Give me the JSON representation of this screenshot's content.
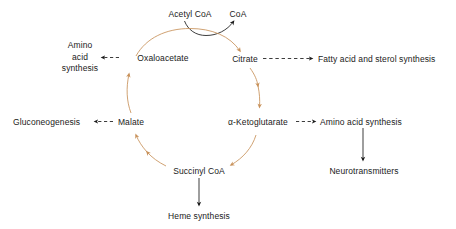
{
  "diagram": {
    "colors": {
      "cycle_arrow": "#c8915a",
      "branch_arrow": "#1a1a1a",
      "text": "#1a1a1a",
      "background": "#ffffff"
    }
  },
  "nodes": {
    "acetyl_coa": "Acetyl CoA",
    "coa": "CoA",
    "oxaloacetate": "Oxaloacetate",
    "citrate": "Citrate",
    "malate": "Malate",
    "ketoglutarate": "α-Ketoglutarate",
    "succinyl_coa": "Succinyl CoA"
  },
  "outputs": {
    "amino_acid_synthesis_left": {
      "line1": "Amino",
      "line2": "acid",
      "line3": "synthesis"
    },
    "fatty_acid_sterol": "Fatty acid and sterol synthesis",
    "gluconeogenesis": "Gluconeogenesis",
    "amino_acid_synthesis_right": "Amino acid synthesis",
    "neurotransmitters": "Neurotransmitters",
    "heme_synthesis": "Heme synthesis"
  },
  "edges": [
    {
      "name": "acetyl-coa-to-coa",
      "style": "solid",
      "color": "#1a1a1a"
    },
    {
      "name": "oxaloacetate-to-citrate",
      "style": "solid",
      "color": "#c8915a"
    },
    {
      "name": "citrate-to-ketoglutarate",
      "style": "solid",
      "color": "#c8915a"
    },
    {
      "name": "ketoglutarate-to-succinyl-coa",
      "style": "solid",
      "color": "#c8915a"
    },
    {
      "name": "succinyl-coa-to-malate",
      "style": "solid",
      "color": "#c8915a"
    },
    {
      "name": "malate-to-oxaloacetate",
      "style": "solid",
      "color": "#c8915a"
    },
    {
      "name": "oxaloacetate-to-amino-acid-synthesis",
      "style": "dashed",
      "color": "#1a1a1a"
    },
    {
      "name": "citrate-to-fatty-acid-and-sterol-synthesis",
      "style": "dashed",
      "color": "#1a1a1a"
    },
    {
      "name": "malate-to-gluconeogenesis",
      "style": "dashed",
      "color": "#1a1a1a"
    },
    {
      "name": "ketoglutarate-to-amino-acid-synthesis",
      "style": "dashed",
      "color": "#1a1a1a"
    },
    {
      "name": "amino-acid-synthesis-to-neurotransmitters",
      "style": "solid",
      "color": "#1a1a1a"
    },
    {
      "name": "succinyl-coa-to-heme-synthesis",
      "style": "solid",
      "color": "#1a1a1a"
    }
  ]
}
